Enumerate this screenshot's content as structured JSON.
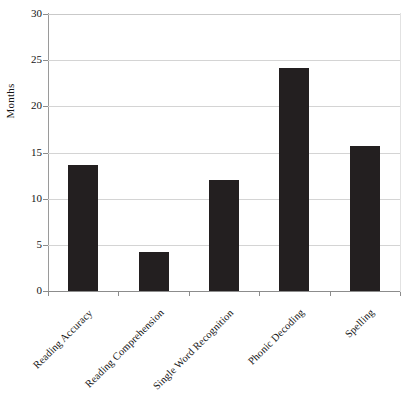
{
  "chart_data": {
    "type": "bar",
    "title": "",
    "xlabel": "",
    "ylabel": "Months",
    "categories": [
      "Reading Accuracy",
      "Reading Comprehension",
      "Single Word Recognition",
      "Phonic Decoding",
      "Spelling"
    ],
    "values": [
      13.6,
      4.2,
      12.0,
      24.1,
      15.7
    ],
    "ylim": [
      0,
      30
    ],
    "yticks": [
      0,
      5,
      10,
      15,
      20,
      25,
      30
    ],
    "ytick_labels": [
      "0",
      "5",
      "10",
      "15",
      "20",
      "25",
      "30"
    ],
    "grid": true,
    "legend": "none",
    "bar_color": "#231f20",
    "gridline_color": "#d4d4d4",
    "axis_color": "#8c8c8c",
    "background": "#ffffff"
  }
}
